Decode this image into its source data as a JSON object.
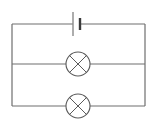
{
  "diagram": {
    "components": [
      {
        "type": "cell",
        "name": "battery",
        "branch": "top"
      },
      {
        "type": "lamp",
        "name": "lamp-1",
        "branch": "middle"
      },
      {
        "type": "lamp",
        "name": "lamp-2",
        "branch": "bottom"
      }
    ],
    "topology": "parallel",
    "colors": {
      "wire": "#6e6e6e",
      "lamp": "#5a5a5a",
      "background": "#ffffff"
    }
  }
}
